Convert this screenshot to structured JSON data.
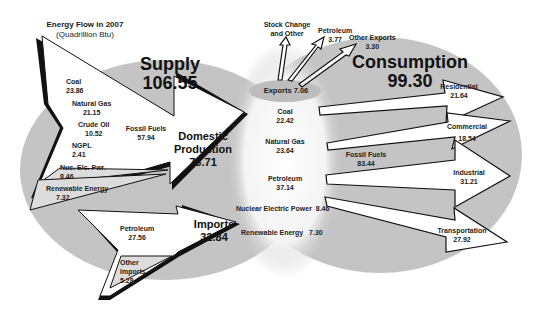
{
  "title": {
    "line1": "Energy  Flow in 2007",
    "line2": "(Quadrillion Btu)"
  },
  "supply": {
    "label": "Supply",
    "value": "106.55"
  },
  "consumption": {
    "label": "Consumption",
    "value": "99.30"
  },
  "domestic_production": {
    "label_1": "Domestic",
    "label_2": "Production",
    "value": "73.71"
  },
  "imports": {
    "label": "Imports",
    "value": "32.84"
  },
  "supply_sources": [
    {
      "label": "Coal",
      "value": "23.86"
    },
    {
      "label": "Natural Gas",
      "value": "21.15"
    },
    {
      "label": "Crude Oil",
      "value": "10.52"
    },
    {
      "label": "NGPL",
      "value": "2.41"
    },
    {
      "label": "Nuc. Elc. Pwr.",
      "value": "8.46"
    },
    {
      "label": "Renewable  Energy",
      "value": "7.32"
    }
  ],
  "fossil_fuels_supply": {
    "label": "Fossil Fuels",
    "value": "57.94"
  },
  "import_sources": [
    {
      "label": "Petroleum",
      "value": "27.56"
    },
    {
      "label_1": "Other",
      "label_2": "Imports",
      "value": "5.28"
    }
  ],
  "exports": {
    "label": "Exports 7.06"
  },
  "export_items": [
    {
      "label_1": "Stock Change",
      "label_2": "and Other"
    },
    {
      "label": "Petroleum",
      "value": "3.77"
    },
    {
      "label": "Other Exports",
      "value": "3.30"
    }
  ],
  "consumption_sources": [
    {
      "label": "Coal",
      "value": "22.42"
    },
    {
      "label": "Natural Gas",
      "value": "23.64"
    },
    {
      "label": "Petroleum",
      "value": "37.14"
    },
    {
      "label": "Nuclear Electric Power",
      "value": "8.46"
    },
    {
      "label": "Renewable Energy",
      "value": "7.30"
    }
  ],
  "fossil_fuels_consumption": {
    "label": "Fossil Fuels",
    "value": "83.44"
  },
  "sectors": [
    {
      "label": "Residential",
      "value": "21.64"
    },
    {
      "label": "Commercial",
      "value": "18.54"
    },
    {
      "label": "Industrial",
      "value": "31.21"
    },
    {
      "label": "Transportation",
      "value": "27.92"
    }
  ],
  "colors": {
    "oval": "#c4c4c4",
    "arrow_fill": "#ffffff",
    "arrow_stroke": "#111111",
    "center_glow": "#ffffff",
    "fossil_bubble": "#b4b4b4"
  }
}
